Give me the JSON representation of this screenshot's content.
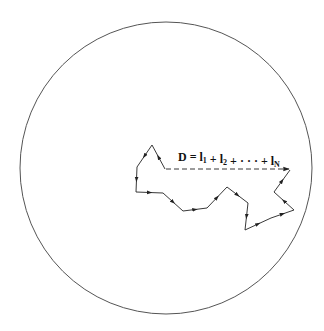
{
  "diagram": {
    "equation": {
      "lhs": "D",
      "equals": "=",
      "terms": [
        {
          "base": "l",
          "sub": "1"
        },
        {
          "base": "l",
          "sub": "2"
        },
        {
          "base": "· · ·",
          "sub": ""
        },
        {
          "base": "l",
          "sub": "N"
        }
      ],
      "plus": "+"
    },
    "circle": {
      "cx": 166,
      "cy": 168,
      "r": 146,
      "stroke": "#555555"
    },
    "path_points": [
      [
        165,
        169
      ],
      [
        152,
        145
      ],
      [
        137,
        167
      ],
      [
        136,
        192
      ],
      [
        163,
        193
      ],
      [
        183,
        211
      ],
      [
        207,
        208
      ],
      [
        227,
        187
      ],
      [
        248,
        203
      ],
      [
        245,
        230
      ],
      [
        271,
        218
      ],
      [
        294,
        210
      ],
      [
        274,
        192
      ],
      [
        290,
        170
      ]
    ],
    "displacement": {
      "from": [
        165,
        169
      ],
      "to": [
        289,
        169
      ],
      "style": "dashed"
    },
    "colors": {
      "line": "#222222",
      "background": "#ffffff"
    }
  }
}
